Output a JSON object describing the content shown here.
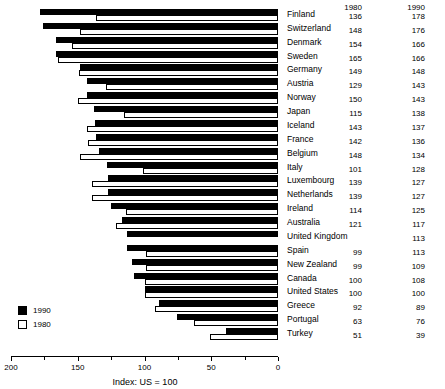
{
  "chart_data": {
    "type": "bar",
    "orientation": "horizontal",
    "title": "",
    "xlabel": "Index: US = 100",
    "ylabel": "",
    "xlim": [
      200,
      0
    ],
    "x_axis_reversed": true,
    "grid": false,
    "legend_position": "bottom-left",
    "value_columns": [
      "1980",
      "1990"
    ],
    "categories": [
      "Finland",
      "Switzerland",
      "Denmark",
      "Sweden",
      "Germany",
      "Austria",
      "Norway",
      "Japan",
      "Iceland",
      "France",
      "Belgium",
      "Italy",
      "Luxembourg",
      "Netherlands",
      "Ireland",
      "Australia",
      "United Kingdom",
      "Spain",
      "New Zealand",
      "Canada",
      "United States",
      "Greece",
      "Portugal",
      "Turkey"
    ],
    "series": [
      {
        "name": "1990",
        "color": "#000000",
        "values": [
          178,
          176,
          166,
          166,
          148,
          143,
          143,
          138,
          137,
          136,
          134,
          128,
          127,
          127,
          125,
          117,
          113,
          113,
          109,
          108,
          100,
          89,
          76,
          39
        ]
      },
      {
        "name": "1980",
        "color": "#ffffff",
        "values": [
          136,
          148,
          154,
          165,
          149,
          129,
          150,
          115,
          143,
          142,
          148,
          101,
          139,
          139,
          114,
          121,
          null,
          99,
          99,
          100,
          100,
          92,
          63,
          51
        ]
      }
    ],
    "ticks_major": [
      200,
      150,
      100,
      50,
      0
    ],
    "ticks_minor": [
      175,
      125,
      75,
      25
    ],
    "tick_labels": [
      "200",
      "150",
      "100",
      "50",
      "0"
    ]
  },
  "header": {
    "col1980": "1980",
    "col1990": "1990"
  },
  "legend": {
    "items": [
      {
        "label": "1990",
        "swatch": "filled"
      },
      {
        "label": "1980",
        "swatch": "hollow"
      }
    ]
  },
  "axis": {
    "title": "Index: US = 100"
  }
}
